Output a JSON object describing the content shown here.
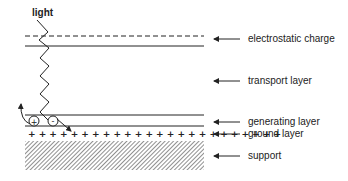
{
  "diagram": {
    "light_label": "light",
    "layers": [
      {
        "id": "electrostatic-charge",
        "label": "electrostatic charge"
      },
      {
        "id": "transport-layer",
        "label": "transport layer"
      },
      {
        "id": "generating-layer",
        "label": "generating layer"
      },
      {
        "id": "ground-layer",
        "label": "ground layer"
      },
      {
        "id": "support",
        "label": "support"
      }
    ],
    "charges": {
      "positive": "+",
      "negative": "-"
    },
    "colors": {
      "line": "#222222",
      "background": "#ffffff"
    }
  }
}
